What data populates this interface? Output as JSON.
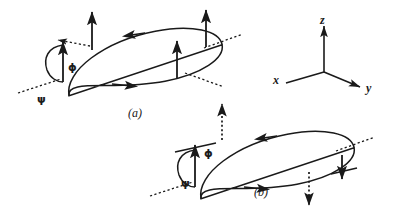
{
  "figure": {
    "kind": "physics-diagram",
    "stroke_color": "#1a1a1a",
    "background_color": "#ffffff",
    "panels": [
      {
        "id": "a",
        "caption": "(a)",
        "caption_x": 128,
        "caption_y": 107,
        "angles": [
          {
            "symbol": "ϕ",
            "name": "phi",
            "x": 68,
            "y": 62
          },
          {
            "symbol": "ψ",
            "name": "psi",
            "x": 37,
            "y": 94
          }
        ],
        "moment_arrows": [
          {
            "name": "moment-arrow-left-outer",
            "direction": "up",
            "style": "solid"
          },
          {
            "name": "moment-arrow-left-tall",
            "direction": "up",
            "style": "solid"
          },
          {
            "name": "moment-arrow-middle",
            "direction": "up",
            "style": "solid"
          },
          {
            "name": "moment-arrow-right-tall",
            "direction": "up",
            "style": "solid"
          }
        ],
        "loop_circulation": "counterclockwise-viewed-from-above"
      },
      {
        "id": "b",
        "caption": "(b)",
        "caption_x": 254,
        "caption_y": 186,
        "angles": [
          {
            "symbol": "ϕ",
            "name": "phi",
            "x": 204,
            "y": 148
          },
          {
            "symbol": "ψ",
            "name": "psi",
            "x": 181,
            "y": 178
          }
        ],
        "moment_arrows": [
          {
            "name": "moment-arrow-left-solid",
            "direction": "up",
            "style": "solid"
          },
          {
            "name": "moment-arrow-left-dotted",
            "direction": "up",
            "style": "dotted"
          },
          {
            "name": "moment-arrow-right-solid",
            "direction": "down",
            "style": "solid"
          },
          {
            "name": "moment-arrow-right-dotted",
            "direction": "down",
            "style": "dotted"
          }
        ],
        "loop_circulation": "clockwise-viewed-from-above"
      }
    ],
    "axes_triad": {
      "name": "coordinate-axes",
      "origin_x": 324,
      "origin_y": 72,
      "labels": [
        {
          "symbol": "z",
          "name": "axis-label-z",
          "x": 320,
          "y": 14
        },
        {
          "symbol": "y",
          "name": "axis-label-y",
          "x": 366,
          "y": 82
        },
        {
          "symbol": "x",
          "name": "axis-label-x",
          "x": 273,
          "y": 80
        }
      ]
    }
  }
}
